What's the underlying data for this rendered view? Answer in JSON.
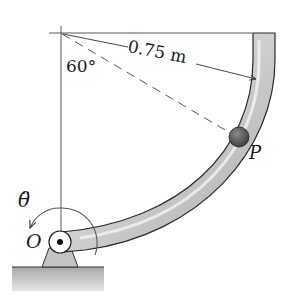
{
  "diagram": {
    "labels": {
      "radius": "0.75 m",
      "angle": "60°",
      "point": "P",
      "pivot": "O",
      "angular_accel": "θ̈"
    },
    "colors": {
      "line": "#333333",
      "tube_fill": "#c8c8c8",
      "tube_highlight": "#efefef",
      "tube_edge": "#2a2a2a",
      "ball": "#5a5a5a",
      "ground": "#b8b8b8",
      "support": "#c4c4c4"
    }
  }
}
